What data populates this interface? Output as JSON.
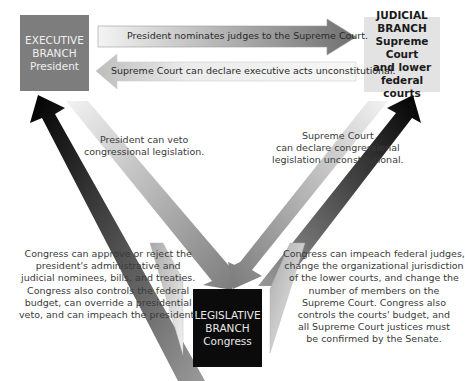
{
  "boxes": {
    "executive": {
      "line1": "EXECUTIVE",
      "line2": "BRANCH",
      "line3": "President",
      "color": "#7d7d7d"
    },
    "judicial": {
      "line1": "JUDICIAL",
      "line2": "BRANCH",
      "line3": "Supreme Court",
      "line4": "and lower",
      "line5": "federal courts",
      "color": "#e3e3e3"
    },
    "legislative": {
      "line1": "LEGISLATIVE",
      "line2": "BRANCH",
      "line3": "Congress",
      "color": "#0b0b0b"
    }
  },
  "arrows": {
    "exec_to_judicial": "President nominates judges to the Supreme Court.",
    "judicial_to_exec": "Supreme Court can declare executive acts unconstitutional.",
    "exec_to_legislative": {
      "lines": [
        "President can veto",
        "congressional legislation."
      ]
    },
    "judicial_to_legislative": {
      "lines": [
        "Supreme Court",
        "can declare congressional",
        "legislation unconstitutional."
      ]
    },
    "legislative_to_exec": {
      "lines": [
        "Congress can approve or reject the",
        "president's administrative and",
        "judicial nominees, bills, and treaties.",
        "Congress also controls the federal",
        "budget, can override a presidential",
        "veto, and can impeach the president."
      ]
    },
    "legislative_to_judicial": {
      "lines": [
        "Congress can impeach federal judges,",
        "change the organizational jurisdiction",
        "of the lower courts, and change the",
        "number of members on the",
        "Supreme Court. Congress also",
        "controls the courts' budget, and",
        "all Supreme Court justices must",
        "be confirmed by the Senate."
      ]
    }
  }
}
